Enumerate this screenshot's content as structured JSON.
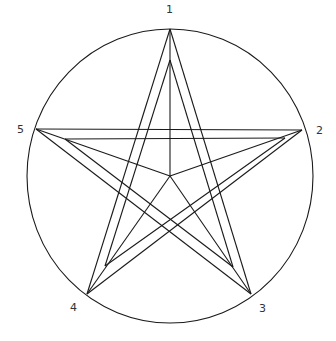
{
  "diagram": {
    "type": "pentagram-in-circle",
    "circle": {
      "cx": 170,
      "cy": 176,
      "rx": 143,
      "ry": 147
    },
    "center": {
      "x": 170,
      "y": 176
    },
    "outer_vertices": [
      {
        "id": "1",
        "x": 170,
        "y": 29
      },
      {
        "id": "2",
        "x": 302,
        "y": 130
      },
      {
        "id": "3",
        "x": 251,
        "y": 294
      },
      {
        "id": "4",
        "x": 87,
        "y": 294
      },
      {
        "id": "5",
        "x": 36,
        "y": 129
      }
    ],
    "inner_vertices": [
      {
        "x": 170,
        "y": 60
      },
      {
        "x": 285,
        "y": 138
      },
      {
        "x": 233,
        "y": 267
      },
      {
        "x": 105,
        "y": 266
      },
      {
        "x": 65,
        "y": 139
      }
    ],
    "labels": [
      {
        "text": "1",
        "x": 166,
        "y": 13
      },
      {
        "text": "2",
        "x": 316,
        "y": 134
      },
      {
        "text": "3",
        "x": 259,
        "y": 312
      },
      {
        "text": "4",
        "x": 70,
        "y": 311
      },
      {
        "text": "5",
        "x": 17,
        "y": 133
      }
    ],
    "line_color": "#1a1a1a",
    "background": "#ffffff"
  }
}
